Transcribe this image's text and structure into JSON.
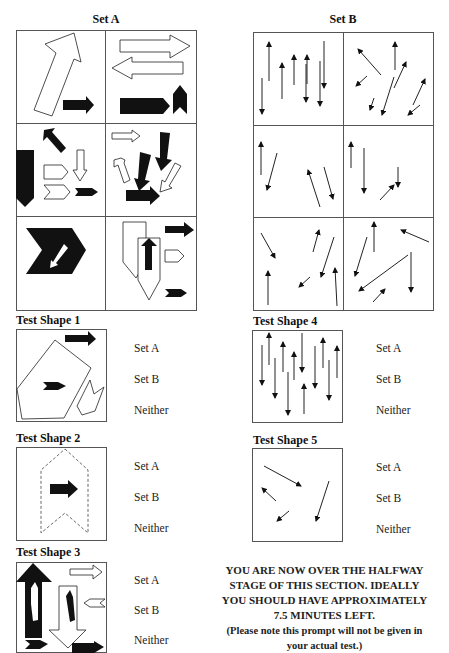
{
  "sets": {
    "a": {
      "title": "Set A"
    },
    "b": {
      "title": "Set B"
    }
  },
  "test_shapes": [
    {
      "title": "Test Shape 1",
      "options": [
        "Set A",
        "Set B",
        "Neither"
      ]
    },
    {
      "title": "Test Shape 2",
      "options": [
        "Set A",
        "Set B",
        "Neither"
      ]
    },
    {
      "title": "Test Shape 3",
      "options": [
        "Set A",
        "Set B",
        "Neither"
      ]
    },
    {
      "title": "Test Shape 4",
      "options": [
        "Set A",
        "Set B",
        "Neither"
      ]
    },
    {
      "title": "Test Shape 5",
      "options": [
        "Set A",
        "Set B",
        "Neither"
      ]
    }
  ],
  "notice": {
    "lines": [
      "YOU ARE NOW OVER THE HALFWAY",
      "STAGE OF THIS SECTION. IDEALLY",
      "YOU SHOULD HAVE APPROXIMATELY",
      "7.5 MINUTES LEFT."
    ],
    "note_lines": [
      "(Please note this prompt will not be given in",
      "your actual test.)"
    ]
  },
  "colors": {
    "ink": "#111111",
    "border": "#555555",
    "background": "#ffffff"
  }
}
